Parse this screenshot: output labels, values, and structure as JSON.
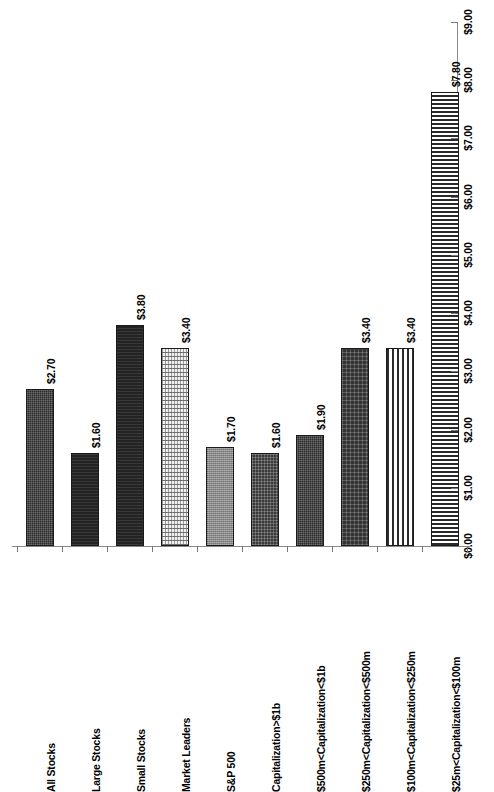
{
  "chart_data": {
    "type": "bar",
    "title": "",
    "subtitle": "",
    "xlabel": "",
    "ylabel": "",
    "orientation": "vertical",
    "rotated_page": true,
    "grid": false,
    "legend": "none",
    "ylim": [
      0,
      9
    ],
    "ytick_step": 1,
    "value_prefix": "$",
    "categories": [
      "All Stocks",
      "Large Stocks",
      "Small Stocks",
      "Market Leaders",
      "S&P 500",
      "Capitalization>$1b",
      "$500m<Capitalization<$1b",
      "$250m<Capitalization<$500m",
      "$100m<Capitalization<$250m",
      "$25m<Capitalization<$100m"
    ],
    "values": [
      2.7,
      1.6,
      3.8,
      3.4,
      1.7,
      1.6,
      1.9,
      3.4,
      3.4,
      7.8
    ],
    "value_labels": [
      "$2.70",
      "$1.60",
      "$3.80",
      "$3.40",
      "$1.70",
      "$1.60",
      "$1.90",
      "$3.40",
      "$3.40",
      "$7.80"
    ],
    "bar_patterns": [
      "dark-dither",
      "dark-solid",
      "dark-solid",
      "light-grid",
      "mid-gray",
      "dark-check",
      "dark-dither",
      "dark-dot",
      "vertical-stripe",
      "horizontal-stripe"
    ],
    "ytick_labels": [
      "$0.00",
      "$1.00",
      "$2.00",
      "$3.00",
      "$4.00",
      "$5.00",
      "$6.00",
      "$7.00",
      "$8.00",
      "$9.00"
    ],
    "ytick_values": [
      0,
      1,
      2,
      3,
      4,
      5,
      6,
      7,
      8,
      9
    ],
    "colors": {
      "axis": "#8a8a8a",
      "tick": "#777777",
      "bar_outline": "#1a1a1a",
      "text": "#000000",
      "background": "#ffffff"
    }
  }
}
